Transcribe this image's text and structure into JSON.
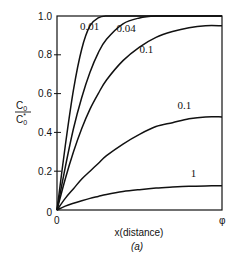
{
  "chart_data": {
    "type": "line",
    "title": "",
    "subtitle": "(a)",
    "xlabel": "x(distance)",
    "ylabel_numerator": "C0",
    "ylabel_denominator": "C0*",
    "ylabel": "C0 / C0*",
    "x_ticks": [
      "0",
      "φ"
    ],
    "y_ticks": [
      "0",
      "0.2",
      "0.4",
      "0.6",
      "0.8",
      "1.0"
    ],
    "xlim": [
      0,
      1
    ],
    "ylim": [
      0,
      1.0
    ],
    "grid": false,
    "legend": "inline curve labels",
    "x": [
      0,
      0.05,
      0.1,
      0.15,
      0.2,
      0.25,
      0.3,
      0.4,
      0.5,
      0.6,
      0.7,
      0.8,
      0.9,
      1.0
    ],
    "series": [
      {
        "name": "0.01",
        "values": [
          0,
          0.33,
          0.62,
          0.83,
          0.95,
          0.99,
          1.0,
          1.0,
          1.0,
          1.0,
          1.0,
          1.0,
          1.0,
          1.0
        ]
      },
      {
        "name": "0.04",
        "values": [
          0,
          0.22,
          0.42,
          0.58,
          0.71,
          0.81,
          0.88,
          0.96,
          0.99,
          1.0,
          1.0,
          1.0,
          1.0,
          1.0
        ]
      },
      {
        "name": "0.1",
        "values": [
          0,
          0.16,
          0.3,
          0.42,
          0.52,
          0.6,
          0.67,
          0.77,
          0.84,
          0.89,
          0.92,
          0.94,
          0.95,
          0.95
        ]
      },
      {
        "name": "0.1",
        "values": [
          0,
          0.06,
          0.11,
          0.16,
          0.2,
          0.24,
          0.28,
          0.34,
          0.39,
          0.43,
          0.45,
          0.47,
          0.48,
          0.48
        ]
      },
      {
        "name": "1",
        "values": [
          0,
          0.02,
          0.035,
          0.048,
          0.06,
          0.07,
          0.08,
          0.095,
          0.105,
          0.113,
          0.118,
          0.122,
          0.124,
          0.125
        ]
      }
    ],
    "label_positions": [
      {
        "text": "0.01",
        "x": 0.14,
        "y": 0.93
      },
      {
        "text": "0.04",
        "x": 0.36,
        "y": 0.92
      },
      {
        "text": "0.1",
        "x": 0.5,
        "y": 0.81
      },
      {
        "text": "0.1",
        "x": 0.73,
        "y": 0.52
      },
      {
        "text": "1",
        "x": 0.81,
        "y": 0.17
      }
    ]
  },
  "labels": {
    "x_axis_title": "x(distance)",
    "subfigure": "(a)",
    "y_num": "C",
    "y_num_sub": "0",
    "y_den": "C",
    "y_den_sub": "0",
    "y_den_sup": "*",
    "x_tick_0": "0",
    "x_tick_end": "φ"
  },
  "style": {
    "line_color": "#111111",
    "background": "#ffffff"
  }
}
